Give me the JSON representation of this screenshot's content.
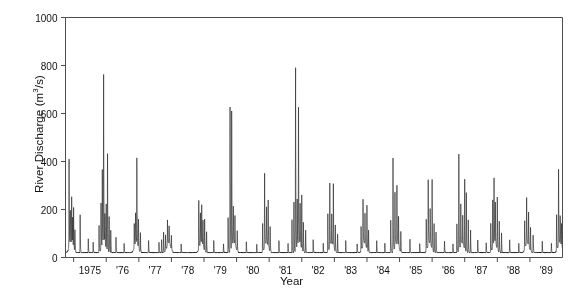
{
  "chart_data": {
    "type": "line",
    "title": "",
    "subtitle": "",
    "xlabel": "Year",
    "ylabel": "River Discharge (m3/s)",
    "ylabel_html": "River Discharge (m<sup>3</sup>/s)",
    "y_unit": "m3/s",
    "xlim": [
      1974.75,
      1990.0
    ],
    "ylim": [
      0,
      1000
    ],
    "yticks": [
      0,
      200,
      400,
      600,
      800,
      1000
    ],
    "ytick_labels": [
      "0",
      "200",
      "400",
      "600",
      "800",
      "1000"
    ],
    "xticks": [
      1975,
      1976,
      1977,
      1978,
      1979,
      1980,
      1981,
      1982,
      1983,
      1984,
      1985,
      1986,
      1987,
      1988,
      1989
    ],
    "xtick_labels": [
      "1975",
      "'76",
      "'77",
      "'78",
      "'79",
      "'80",
      "'81",
      "'82",
      "'83",
      "'84",
      "'85",
      "'86",
      "'87",
      "'88",
      "'89"
    ],
    "grid": false,
    "legend": null,
    "legend_position": "none",
    "line_color": "#1a1a1a",
    "line_width": 0.6,
    "frame_color": "#4d4d4d",
    "background": "#ffffff",
    "series_name": "River discharge",
    "sampling": "daily",
    "baseflow_low": 8,
    "baseflow_high": 38,
    "peaks": [
      {
        "time": 1974.86,
        "value": 370
      },
      {
        "time": 1974.9,
        "value": 150
      },
      {
        "time": 1974.94,
        "value": 200
      },
      {
        "time": 1974.97,
        "value": 120
      },
      {
        "time": 1975.0,
        "value": 175
      },
      {
        "time": 1975.04,
        "value": 95
      },
      {
        "time": 1975.2,
        "value": 160
      },
      {
        "time": 1975.45,
        "value": 60
      },
      {
        "time": 1975.6,
        "value": 45
      },
      {
        "time": 1975.78,
        "value": 115
      },
      {
        "time": 1975.84,
        "value": 205
      },
      {
        "time": 1975.88,
        "value": 330
      },
      {
        "time": 1975.92,
        "value": 700
      },
      {
        "time": 1975.96,
        "value": 140
      },
      {
        "time": 1976.0,
        "value": 190
      },
      {
        "time": 1976.04,
        "value": 430
      },
      {
        "time": 1976.09,
        "value": 150
      },
      {
        "time": 1976.14,
        "value": 95
      },
      {
        "time": 1976.3,
        "value": 70
      },
      {
        "time": 1976.55,
        "value": 40
      },
      {
        "time": 1976.86,
        "value": 100
      },
      {
        "time": 1976.9,
        "value": 140
      },
      {
        "time": 1976.94,
        "value": 365
      },
      {
        "time": 1976.99,
        "value": 130
      },
      {
        "time": 1977.05,
        "value": 85
      },
      {
        "time": 1977.3,
        "value": 55
      },
      {
        "time": 1977.62,
        "value": 45
      },
      {
        "time": 1977.7,
        "value": 60
      },
      {
        "time": 1977.76,
        "value": 95
      },
      {
        "time": 1977.82,
        "value": 70
      },
      {
        "time": 1977.88,
        "value": 110
      },
      {
        "time": 1977.93,
        "value": 80
      },
      {
        "time": 1978.0,
        "value": 60
      },
      {
        "time": 1978.3,
        "value": 40
      },
      {
        "time": 1978.84,
        "value": 215
      },
      {
        "time": 1978.89,
        "value": 130
      },
      {
        "time": 1978.93,
        "value": 175
      },
      {
        "time": 1978.97,
        "value": 110
      },
      {
        "time": 1979.02,
        "value": 140
      },
      {
        "time": 1979.08,
        "value": 90
      },
      {
        "time": 1979.3,
        "value": 55
      },
      {
        "time": 1979.6,
        "value": 38
      },
      {
        "time": 1979.74,
        "value": 150
      },
      {
        "time": 1979.8,
        "value": 610
      },
      {
        "time": 1979.85,
        "value": 605
      },
      {
        "time": 1979.9,
        "value": 170
      },
      {
        "time": 1979.95,
        "value": 120
      },
      {
        "time": 1980.02,
        "value": 90
      },
      {
        "time": 1980.3,
        "value": 50
      },
      {
        "time": 1980.62,
        "value": 38
      },
      {
        "time": 1980.8,
        "value": 120
      },
      {
        "time": 1980.86,
        "value": 310
      },
      {
        "time": 1980.92,
        "value": 150
      },
      {
        "time": 1980.97,
        "value": 195
      },
      {
        "time": 1981.03,
        "value": 105
      },
      {
        "time": 1981.3,
        "value": 55
      },
      {
        "time": 1981.58,
        "value": 40
      },
      {
        "time": 1981.7,
        "value": 150
      },
      {
        "time": 1981.76,
        "value": 230
      },
      {
        "time": 1981.81,
        "value": 795
      },
      {
        "time": 1981.86,
        "value": 200
      },
      {
        "time": 1981.9,
        "value": 620
      },
      {
        "time": 1981.95,
        "value": 170
      },
      {
        "time": 1982.0,
        "value": 230
      },
      {
        "time": 1982.05,
        "value": 130
      },
      {
        "time": 1982.12,
        "value": 95
      },
      {
        "time": 1982.35,
        "value": 55
      },
      {
        "time": 1982.66,
        "value": 40
      },
      {
        "time": 1982.8,
        "value": 160
      },
      {
        "time": 1982.86,
        "value": 270
      },
      {
        "time": 1982.92,
        "value": 120
      },
      {
        "time": 1982.97,
        "value": 265
      },
      {
        "time": 1983.03,
        "value": 110
      },
      {
        "time": 1983.1,
        "value": 85
      },
      {
        "time": 1983.35,
        "value": 50
      },
      {
        "time": 1983.7,
        "value": 40
      },
      {
        "time": 1983.82,
        "value": 110
      },
      {
        "time": 1983.88,
        "value": 200
      },
      {
        "time": 1983.94,
        "value": 130
      },
      {
        "time": 1984.0,
        "value": 185
      },
      {
        "time": 1984.05,
        "value": 95
      },
      {
        "time": 1984.3,
        "value": 55
      },
      {
        "time": 1984.55,
        "value": 40
      },
      {
        "time": 1984.73,
        "value": 150
      },
      {
        "time": 1984.8,
        "value": 395
      },
      {
        "time": 1984.86,
        "value": 230
      },
      {
        "time": 1984.92,
        "value": 240
      },
      {
        "time": 1984.97,
        "value": 125
      },
      {
        "time": 1985.04,
        "value": 90
      },
      {
        "time": 1985.32,
        "value": 55
      },
      {
        "time": 1985.62,
        "value": 40
      },
      {
        "time": 1985.82,
        "value": 140
      },
      {
        "time": 1985.88,
        "value": 285
      },
      {
        "time": 1985.94,
        "value": 150
      },
      {
        "time": 1986.0,
        "value": 295
      },
      {
        "time": 1986.06,
        "value": 120
      },
      {
        "time": 1986.12,
        "value": 85
      },
      {
        "time": 1986.38,
        "value": 50
      },
      {
        "time": 1986.64,
        "value": 40
      },
      {
        "time": 1986.76,
        "value": 130
      },
      {
        "time": 1986.82,
        "value": 430
      },
      {
        "time": 1986.88,
        "value": 180
      },
      {
        "time": 1986.94,
        "value": 120
      },
      {
        "time": 1987.0,
        "value": 295
      },
      {
        "time": 1987.05,
        "value": 260
      },
      {
        "time": 1987.11,
        "value": 140
      },
      {
        "time": 1987.18,
        "value": 95
      },
      {
        "time": 1987.4,
        "value": 55
      },
      {
        "time": 1987.66,
        "value": 40
      },
      {
        "time": 1987.8,
        "value": 120
      },
      {
        "time": 1987.86,
        "value": 200
      },
      {
        "time": 1987.9,
        "value": 300
      },
      {
        "time": 1987.94,
        "value": 175
      },
      {
        "time": 1988.0,
        "value": 220
      },
      {
        "time": 1988.06,
        "value": 130
      },
      {
        "time": 1988.13,
        "value": 90
      },
      {
        "time": 1988.38,
        "value": 55
      },
      {
        "time": 1988.66,
        "value": 40
      },
      {
        "time": 1988.84,
        "value": 125
      },
      {
        "time": 1988.9,
        "value": 210
      },
      {
        "time": 1988.96,
        "value": 150
      },
      {
        "time": 1989.02,
        "value": 105
      },
      {
        "time": 1989.1,
        "value": 80
      },
      {
        "time": 1989.38,
        "value": 50
      },
      {
        "time": 1989.66,
        "value": 38
      },
      {
        "time": 1989.82,
        "value": 160
      },
      {
        "time": 1989.88,
        "value": 330
      },
      {
        "time": 1989.93,
        "value": 125
      },
      {
        "time": 1989.97,
        "value": 95
      }
    ],
    "annual_hump_peak_month": 0.92,
    "annual_hump_amplitude": 48,
    "max_value": 795,
    "max_value_year": 1981
  },
  "axes": {
    "y_title": "River Discharge (m3/s)",
    "x_title": "Year"
  }
}
